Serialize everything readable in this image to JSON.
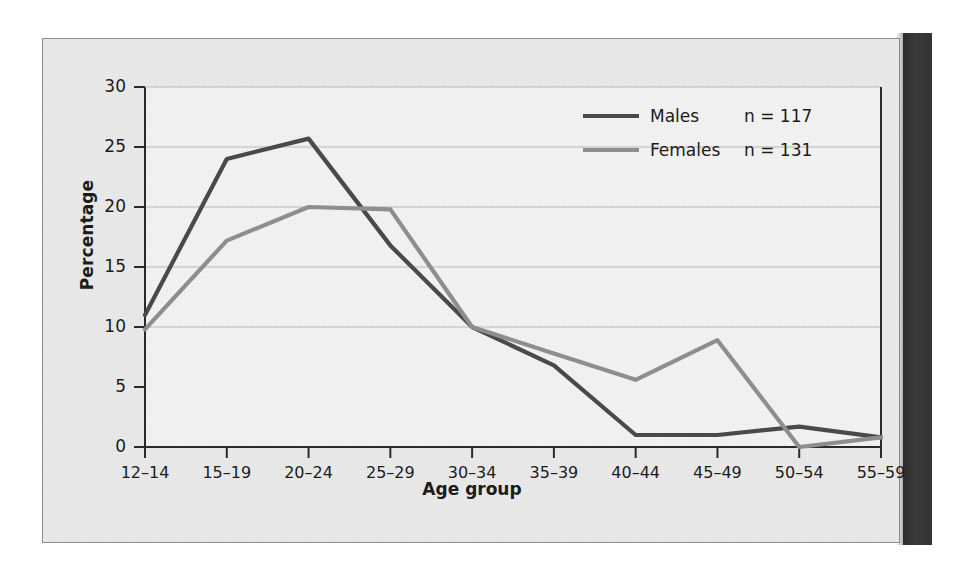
{
  "figure": {
    "background_color": "#e9e9e9",
    "plot_background_color": "#f2f2f2",
    "border_color": "#8d8d8d"
  },
  "chart_data": {
    "type": "line",
    "title": "",
    "subtitle": "",
    "xlabel": "Age group",
    "ylabel": "Percentage",
    "categories": [
      "12–14",
      "15–19",
      "20–24",
      "25–29",
      "30–34",
      "35–39",
      "40–44",
      "45–49",
      "50–54",
      "55–59"
    ],
    "ylim": [
      0,
      30
    ],
    "yticks": [
      0,
      5,
      10,
      15,
      20,
      25,
      30
    ],
    "ytick_labels": [
      "0",
      "5",
      "10",
      "15",
      "20",
      "25",
      "30"
    ],
    "gridlines": [
      10,
      15,
      20,
      25
    ],
    "grid": true,
    "legend_position": "top-right",
    "series": [
      {
        "name": "Males",
        "n_label": "n = 117",
        "n": 117,
        "color": "#4a4a4a",
        "values": [
          11.0,
          24.0,
          25.7,
          16.8,
          10.0,
          6.8,
          1.0,
          1.0,
          1.7,
          0.8
        ]
      },
      {
        "name": "Females",
        "n_label": "n = 131",
        "n": 131,
        "color": "#8f8f8f",
        "values": [
          9.8,
          17.2,
          20.0,
          19.8,
          10.0,
          7.8,
          5.6,
          8.9,
          0.0,
          0.8
        ]
      }
    ]
  }
}
